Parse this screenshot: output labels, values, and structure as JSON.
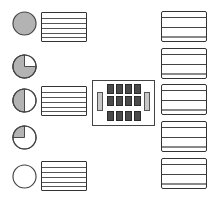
{
  "diagram": {
    "colors": {
      "stroke": "#333333",
      "fill_gray": "#b3b3b3",
      "cell_dark": "#4a4a4a",
      "side_bar": "#c8c8c8",
      "background": "#ffffff"
    },
    "left_indicators": [
      {
        "id": "indicator-1",
        "fill_fraction": 1.0,
        "has_table": true
      },
      {
        "id": "indicator-2",
        "fill_fraction": 0.75,
        "has_table": false
      },
      {
        "id": "indicator-3",
        "fill_fraction": 0.5,
        "has_table": true
      },
      {
        "id": "indicator-4",
        "fill_fraction": 0.25,
        "has_table": false
      },
      {
        "id": "indicator-5",
        "fill_fraction": 0.0,
        "has_table": true
      }
    ],
    "center_unit": {
      "grid_columns": 4,
      "grid_rows": 3,
      "side_bars": 2
    },
    "right_tables": [
      {
        "id": "right-table-1"
      },
      {
        "id": "right-table-2"
      },
      {
        "id": "right-table-3"
      },
      {
        "id": "right-table-4"
      },
      {
        "id": "right-table-5"
      }
    ]
  }
}
